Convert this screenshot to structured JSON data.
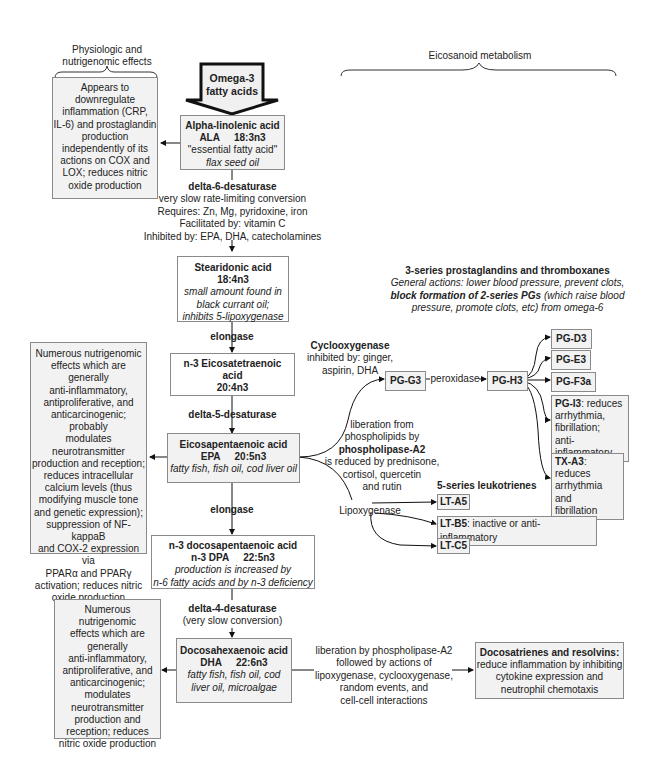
{
  "headers": {
    "left": [
      "Physiologic and",
      "nutrigenomic effects"
    ],
    "right": "Eicosanoid metabolism"
  },
  "omega_arrow": {
    "label": [
      "Omega-3",
      "fatty acids"
    ]
  },
  "ala": {
    "name": "Alpha-linolenic acid",
    "abbr": "ALA",
    "formula": "18:3n3",
    "note": "\"essential fatty acid\"",
    "source": "flax seed oil"
  },
  "ala_effects": [
    "Appears to",
    "downregulate",
    "inflammation (CRP,",
    "IL-6) and prostaglandin",
    "production",
    "independently of its",
    "actions on COX and",
    "LOX; reduces nitric",
    "oxide production"
  ],
  "d6": {
    "name": "delta-6-desaturase",
    "lines": [
      "very slow rate-limiting conversion",
      "Requires: Zn, Mg, pyridoxine, iron",
      "Facilitated by: vitamin C",
      "Inhibited by: EPA, DHA, catecholamines"
    ]
  },
  "sda": {
    "name": "Stearidonic acid",
    "formula": "18:4n3",
    "notes": [
      "small amount found in",
      "black currant oil;",
      "inhibits 5-lipoxygenase"
    ]
  },
  "elongase1": "elongase",
  "eta": {
    "lines": [
      "n-3 Eicosatetraenoic",
      "acid",
      "20:4n3"
    ]
  },
  "d5": "delta-5-desaturase",
  "epa": {
    "name": "Eicosapentaenoic acid",
    "abbr": "EPA",
    "formula": "20:5n3",
    "source": "fatty fish, fish oil, cod liver oil"
  },
  "epa_effects": [
    "Numerous nutrigenomic",
    "effects which are generally",
    "anti-inflammatory,",
    "antiproliferative, and",
    "anticarcinogenic; probably",
    "modulates",
    "neurotransmitter",
    "production and reception;",
    "reduces intracellular",
    "calcium levels (thus",
    "modifying muscle tone",
    "and genetic expression);",
    "suppression of NF-kappaB",
    "and COX-2 expression via",
    "PPARα and PPARγ",
    "activation; reduces nitric",
    "oxide production"
  ],
  "elongase2": "elongase",
  "dpa": {
    "name": "n-3 docosapentaenoic acid",
    "abbr": "n-3 DPA",
    "formula": "22:5n3",
    "notes": [
      "production is increased by",
      "n-6 fatty acids and by n-3 deficiency"
    ]
  },
  "d4": {
    "name": "delta-4-desaturase",
    "note": "(very slow conversion)"
  },
  "dha": {
    "name": "Docosahexaenoic acid",
    "abbr": "DHA",
    "formula": "22:6n3",
    "source": [
      "fatty fish, fish oil, cod",
      "liver oil, microalgae"
    ]
  },
  "dha_effects": [
    "Numerous nutrigenomic",
    "effects which are",
    "generally",
    "anti-inflammatory,",
    "antiproliferative, and",
    "anticarcinogenic;",
    "modulates",
    "neurotransmitter",
    "production and",
    "reception; reduces",
    "nitric oxide production"
  ],
  "prostaglandins": {
    "title": "3-series prostaglandins and thromboxanes",
    "general_prefix": "General actions: lower blood pressure, prevent clots,",
    "block_bold": "block formation of 2-series PGs",
    "block_rest": " (which raise blood",
    "line3": "pressure, promote clots, etc) from omega-6"
  },
  "cox": {
    "name": "Cyclooxygenase",
    "lines": [
      "inhibited by: ginger,",
      "aspirin, DHA"
    ]
  },
  "pla2": {
    "lines_pre": [
      "liberation from",
      "phospholipids by"
    ],
    "bold": "phospholipase-A2",
    "lines_post": [
      "is reduced by prednisone,",
      "cortisol, quercetin",
      "and rutin"
    ]
  },
  "peroxidase": "peroxidase",
  "pg_nodes": {
    "g3": "PG-G3",
    "h3": "PG-H3",
    "d3": "PG-D3",
    "e3": "PG-E3",
    "f3a": "PG-F3a",
    "i3": {
      "name": "PG-I3",
      "desc": [
        ": reduces",
        "arrhythmia,",
        "fibrillation;",
        "anti-inflammatory"
      ]
    },
    "tx": {
      "name": "TX-A3",
      "desc": [
        ": reduces",
        "arrhythmia and",
        "fibrillation"
      ]
    }
  },
  "leukotrienes": {
    "title": "5-series leukotrienes",
    "lipoxygenase": "Lipoxygenase",
    "a5": "LT-A5",
    "b5": {
      "name": "LT-B5",
      "desc": ": inactive or anti-inflammatory"
    },
    "c5": "LT-C5"
  },
  "dha_liberation": [
    "liberation by phospholipase-A2",
    "followed by actions of",
    "lipoxygenase, cyclooxygenase,",
    "random events, and",
    "cell-cell interactions"
  ],
  "resolvins": {
    "title": "Docosatrienes and resolvins:",
    "lines": [
      "reduce inflammation by inhibiting",
      "cytokine expression and",
      "neutrophil chemotaxis"
    ]
  }
}
